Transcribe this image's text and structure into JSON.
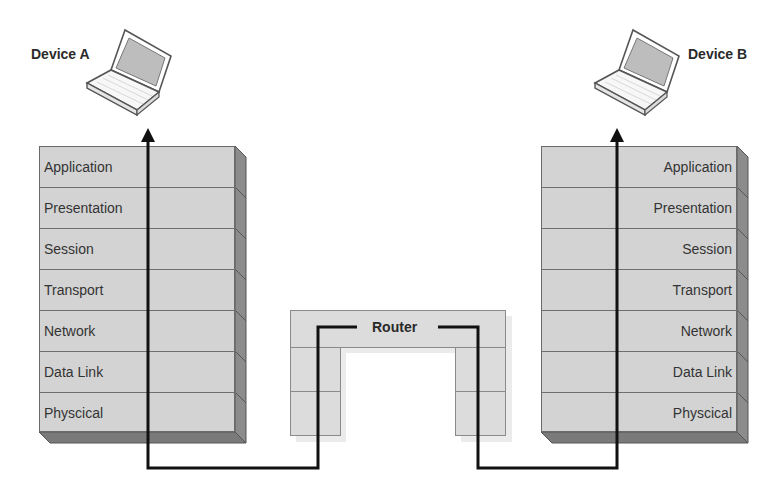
{
  "diagram": {
    "type": "OSI model communication via router",
    "devices": [
      {
        "id": "device-a",
        "label": "Device A",
        "icon": "laptop-icon"
      },
      {
        "id": "device-b",
        "label": "Device B",
        "icon": "laptop-icon"
      }
    ],
    "left_stack": {
      "layers": [
        "Application",
        "Presentation",
        "Session",
        "Transport",
        "Network",
        "Data Link",
        "Physcical"
      ]
    },
    "right_stack": {
      "layers": [
        "Application",
        "Presentation",
        "Session",
        "Transport",
        "Network",
        "Data Link",
        "Physcical"
      ]
    },
    "router": {
      "label": "Router",
      "layers_spanned": [
        "Network",
        "Data Link",
        "Physcical"
      ]
    },
    "path": {
      "description": "Data flows from Device A down through all layers, across to Router up to Network layer, back down, across to Device B and up through all layers",
      "arrows": [
        "up-arrow-to-device-a",
        "up-arrow-to-device-b"
      ]
    },
    "colors": {
      "layer_fill": "#d3d3d3",
      "layer_border": "#6f6f6f",
      "side_depth": "#8c8c8c",
      "bottom_depth": "#7a7a7a",
      "path_line": "#111111",
      "router_fill": "#dcdcdc"
    }
  }
}
